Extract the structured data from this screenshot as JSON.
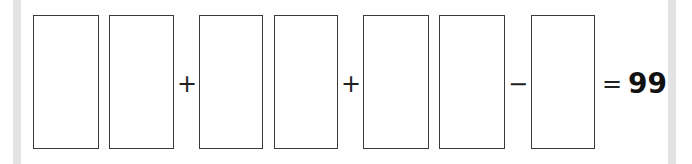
{
  "equation": {
    "digit_boxes": [
      {
        "value": ""
      },
      {
        "value": ""
      },
      {
        "value": ""
      },
      {
        "value": ""
      },
      {
        "value": ""
      },
      {
        "value": ""
      },
      {
        "value": ""
      }
    ],
    "operators": [
      "+",
      "+",
      "−"
    ],
    "equals": "=",
    "result": "99"
  }
}
